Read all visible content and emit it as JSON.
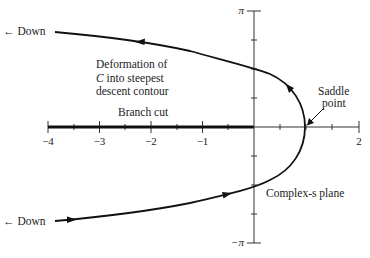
{
  "diagram": {
    "plane_label": "Complex-s plane",
    "x_axis": {
      "ticks": [
        "−4",
        "−3",
        "−2",
        "−1",
        "2"
      ],
      "range": [
        -4,
        2
      ],
      "minor_tick_step": 0.5
    },
    "y_axis": {
      "top_label": "π",
      "bottom_label": "−π",
      "range": [
        "−π",
        "π"
      ],
      "tick_step": "π/4"
    },
    "annotations": {
      "down_upper": "← Down",
      "down_lower": "← Down",
      "deformation_line1": "Deformation of",
      "deformation_line2_italic": "C",
      "deformation_line2_rest": " into steepest",
      "deformation_line3": "descent contour",
      "branch_cut": "Branch cut",
      "saddle_line1": "Saddle",
      "saddle_line2": "point"
    },
    "contour": {
      "saddle_point_x": 1,
      "imag_axis_crossings": [
        "π/2",
        "−π/2"
      ],
      "direction": "from lower-left to saddle, then to upper-left"
    },
    "colors": {
      "ink": "#222222",
      "background": "#ffffff"
    }
  }
}
